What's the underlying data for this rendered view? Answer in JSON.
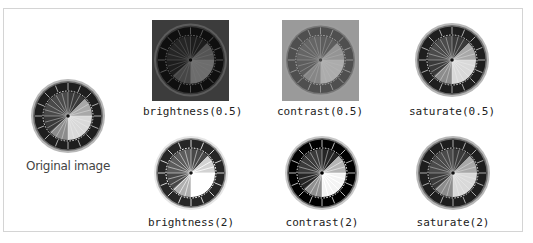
{
  "figure": {
    "tiles": [
      {
        "id": "original",
        "caption": "Original image",
        "filter": "none"
      },
      {
        "id": "brightness-low",
        "caption": "brightness(0.5)",
        "filter": "brightness(0.5)"
      },
      {
        "id": "contrast-low",
        "caption": "contrast(0.5)",
        "filter": "contrast(0.5)"
      },
      {
        "id": "saturate-low",
        "caption": "saturate(0.5)",
        "filter": "saturate(0.5)"
      },
      {
        "id": "brightness-high",
        "caption": "brightness(2)",
        "filter": "brightness(2)"
      },
      {
        "id": "contrast-high",
        "caption": "contrast(2)",
        "filter": "contrast(2)"
      },
      {
        "id": "saturate-high",
        "caption": "saturate(2)",
        "filter": "saturate(2)"
      }
    ]
  },
  "colors": {
    "frame_border": "#d4d4d4",
    "wheel_dark": "#1a1a1a",
    "wheel_rim": "#8a8a8a",
    "brightness_low_bg": "#3c3c3c",
    "contrast_low_bg": "#9a9a9a"
  }
}
